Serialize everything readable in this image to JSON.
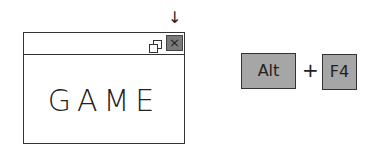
{
  "window": {
    "content_text": "GAME",
    "controls": {
      "minimize": "minimize-icon",
      "restore": "restore-icon",
      "close_glyph": "×"
    }
  },
  "pointer_arrow": "↓",
  "shortcut": {
    "key1": "Alt",
    "plus": "+",
    "key2": "F4"
  }
}
